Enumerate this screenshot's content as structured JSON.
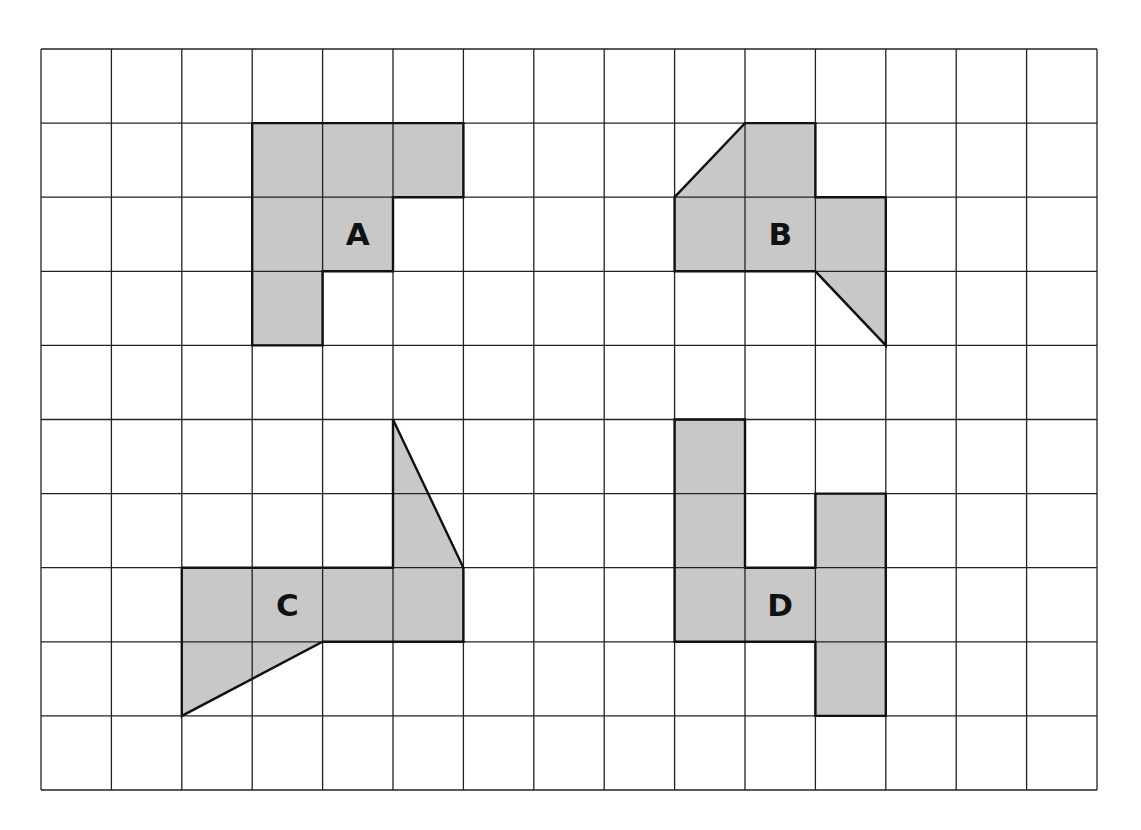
{
  "diagram": {
    "type": "grid-shapes",
    "grid": {
      "columns": 15,
      "rows": 10,
      "origin_px": [
        41,
        49
      ],
      "cell_width_px": 70.4,
      "cell_height_px": 74.1,
      "line_color": "#222222",
      "background": "#ffffff"
    },
    "fill_color": "#c8c8c8",
    "outline_color": "#111111",
    "shapes": [
      {
        "id": "A",
        "label": "A",
        "label_cell": [
          4,
          2
        ],
        "vertices": [
          [
            3,
            1
          ],
          [
            6,
            1
          ],
          [
            6,
            2
          ],
          [
            5,
            2
          ],
          [
            5,
            3
          ],
          [
            4,
            3
          ],
          [
            4,
            4
          ],
          [
            3,
            4
          ]
        ]
      },
      {
        "id": "B",
        "label": "B",
        "label_cell": [
          10,
          2
        ],
        "vertices": [
          [
            9,
            2
          ],
          [
            10,
            1
          ],
          [
            11,
            1
          ],
          [
            11,
            2
          ],
          [
            12,
            2
          ],
          [
            12,
            4
          ],
          [
            11,
            3
          ],
          [
            9,
            3
          ]
        ]
      },
      {
        "id": "C",
        "label": "C",
        "label_cell": [
          3,
          7
        ],
        "vertices": [
          [
            2,
            7
          ],
          [
            5,
            7
          ],
          [
            5,
            5
          ],
          [
            6,
            7
          ],
          [
            6,
            8
          ],
          [
            4,
            8
          ],
          [
            2,
            9
          ]
        ]
      },
      {
        "id": "D",
        "label": "D",
        "label_cell": [
          10,
          7
        ],
        "vertices": [
          [
            9,
            5
          ],
          [
            10,
            5
          ],
          [
            10,
            7
          ],
          [
            11,
            7
          ],
          [
            11,
            6
          ],
          [
            12,
            6
          ],
          [
            12,
            9
          ],
          [
            11,
            9
          ],
          [
            11,
            8
          ],
          [
            9,
            8
          ]
        ]
      }
    ]
  }
}
